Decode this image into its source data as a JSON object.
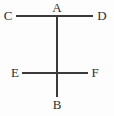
{
  "figure": {
    "width": 114,
    "height": 116,
    "background_color": "#fdfdfd",
    "stroke_color": "#3a3a3a",
    "label_color": "#2e2e2e",
    "stroke_width": 1.6,
    "labels": {
      "a": "A",
      "b": "B",
      "c": "C",
      "d": "D",
      "e": "E",
      "f": "F"
    },
    "points": [
      {
        "name": "A",
        "label": "A",
        "x": 57,
        "y": 15
      },
      {
        "name": "B",
        "label": "B",
        "x": 57,
        "y": 97
      },
      {
        "name": "C",
        "label": "C",
        "x": 16,
        "y": 16
      },
      {
        "name": "D",
        "label": "D",
        "x": 93,
        "y": 16
      },
      {
        "name": "E",
        "label": "E",
        "x": 22,
        "y": 73
      },
      {
        "name": "F",
        "label": "F",
        "x": 88,
        "y": 73
      }
    ],
    "segments": [
      {
        "name": "segment-ab",
        "from": "A",
        "to": "B",
        "orientation": "vertical",
        "x1": 57,
        "y1": 15,
        "x2": 57,
        "y2": 97
      },
      {
        "name": "segment-cd",
        "from": "C",
        "to": "D",
        "orientation": "horizontal",
        "x1": 16,
        "y1": 16,
        "x2": 93,
        "y2": 16
      },
      {
        "name": "segment-ef",
        "from": "E",
        "to": "F",
        "orientation": "horizontal",
        "x1": 22,
        "y1": 73,
        "x2": 88,
        "y2": 73
      }
    ],
    "intersections": [
      {
        "name": "intersection-a",
        "label": "A",
        "x": 57,
        "y": 16,
        "segments": [
          "segment-ab",
          "segment-cd"
        ]
      },
      {
        "name": "intersection-ef-ab",
        "label": "",
        "x": 57,
        "y": 73,
        "segments": [
          "segment-ab",
          "segment-ef"
        ]
      }
    ]
  }
}
